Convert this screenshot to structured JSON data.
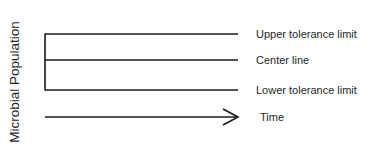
{
  "diagram": {
    "y_axis_label": "Microbial Population",
    "lines": [
      {
        "id": "upper",
        "label": "Upper tolerance limit"
      },
      {
        "id": "center",
        "label": "Center line"
      },
      {
        "id": "lower",
        "label": "Lower tolerance limit"
      }
    ],
    "x_axis_label": "Time",
    "line_color": "#1a1a1a"
  }
}
